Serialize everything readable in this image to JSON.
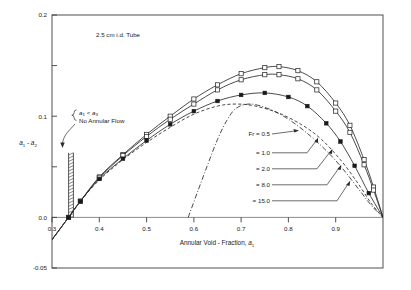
{
  "chart_data": {
    "type": "line",
    "title": "2.5 cm i.d. Tube",
    "xlabel": "Annular Void - Fraction, a1",
    "ylabel": "a1 - a2",
    "xlim": [
      0.3,
      1.0
    ],
    "ylim": [
      -0.05,
      0.2
    ],
    "grid": false,
    "legend_position": "inside-right",
    "xticks": [
      "0.3",
      "0.4",
      "0.5",
      "0.6",
      "0.7",
      "0.8",
      "0.9"
    ],
    "xtick_values": [
      0.3,
      0.4,
      0.5,
      0.6,
      0.7,
      0.8,
      0.9
    ],
    "yticks": [
      "0.2",
      "0.1",
      "0.0",
      "-0.05"
    ],
    "ytick_values": [
      0.2,
      0.1,
      0.0,
      -0.05
    ],
    "yminor_values": [
      0.15,
      0.05
    ],
    "annotations": [
      {
        "id": "tube-note",
        "text": "2.5 cm i.d. Tube",
        "x": 0.42,
        "y": 0.178
      },
      {
        "id": "no-flow-line1",
        "text": "a1 < a3",
        "x": 0.355,
        "y": 0.123
      },
      {
        "id": "no-flow-line2",
        "text": "No Annular Flow",
        "x": 0.355,
        "y": 0.113
      }
    ],
    "series": [
      {
        "name": "Fr = 0.5",
        "legend_label": "Fr  =  0.5",
        "style": "solid",
        "marker": "open-square",
        "x": [
          0.3,
          0.335,
          0.36,
          0.4,
          0.45,
          0.5,
          0.55,
          0.6,
          0.65,
          0.7,
          0.75,
          0.78,
          0.82,
          0.86,
          0.9,
          0.93,
          0.96,
          0.98,
          1.0
        ],
        "values": [
          -0.022,
          0.0,
          0.016,
          0.04,
          0.062,
          0.082,
          0.1,
          0.117,
          0.131,
          0.142,
          0.148,
          0.149,
          0.145,
          0.134,
          0.113,
          0.091,
          0.057,
          0.03,
          0.0
        ]
      },
      {
        "name": "Fr = 1.0",
        "legend_label": "=  1.0",
        "style": "solid",
        "marker": "open-square",
        "x": [
          0.3,
          0.335,
          0.36,
          0.4,
          0.45,
          0.5,
          0.55,
          0.6,
          0.65,
          0.7,
          0.75,
          0.78,
          0.82,
          0.86,
          0.9,
          0.93,
          0.96,
          0.98,
          1.0
        ],
        "values": [
          -0.022,
          0.0,
          0.016,
          0.039,
          0.061,
          0.08,
          0.097,
          0.112,
          0.126,
          0.136,
          0.141,
          0.141,
          0.137,
          0.126,
          0.105,
          0.084,
          0.052,
          0.027,
          0.0
        ]
      },
      {
        "name": "Fr = 2.0",
        "legend_label": "=  2.0",
        "style": "solid",
        "marker": "filled-square",
        "x": [
          0.3,
          0.335,
          0.36,
          0.4,
          0.45,
          0.5,
          0.55,
          0.6,
          0.65,
          0.7,
          0.75,
          0.8,
          0.84,
          0.88,
          0.91,
          0.94,
          0.97,
          1.0
        ],
        "values": [
          -0.022,
          0.0,
          0.016,
          0.038,
          0.058,
          0.076,
          0.092,
          0.105,
          0.115,
          0.121,
          0.123,
          0.119,
          0.11,
          0.093,
          0.075,
          0.051,
          0.024,
          0.0
        ]
      },
      {
        "name": "Fr = 8.0",
        "legend_label": "=  8.0",
        "style": "dashed",
        "marker": "none",
        "x": [
          0.3,
          0.335,
          0.36,
          0.4,
          0.45,
          0.5,
          0.55,
          0.6,
          0.65,
          0.69,
          0.73,
          0.78,
          0.83,
          0.87,
          0.91,
          0.945,
          0.975,
          1.0
        ],
        "values": [
          -0.022,
          0.0,
          0.016,
          0.037,
          0.057,
          0.074,
          0.089,
          0.102,
          0.11,
          0.112,
          0.11,
          0.103,
          0.091,
          0.077,
          0.057,
          0.035,
          0.014,
          0.0
        ]
      },
      {
        "name": "Fr = 15.0",
        "legend_label": "=  15.0",
        "style": "dash-dot",
        "marker": "none",
        "x": [
          0.588,
          0.61,
          0.63,
          0.65,
          0.67,
          0.69,
          0.72,
          0.76,
          0.8,
          0.84,
          0.88,
          0.915,
          0.95,
          0.975,
          1.0
        ],
        "values": [
          0.0,
          0.028,
          0.053,
          0.077,
          0.096,
          0.108,
          0.112,
          0.107,
          0.097,
          0.083,
          0.066,
          0.048,
          0.027,
          0.012,
          0.0
        ]
      }
    ],
    "regions": [
      {
        "id": "no-annular-flow-hatch",
        "label": "No Annular Flow boundary",
        "x": 0.335,
        "y_bottom": 0.0,
        "y_top": 0.052
      }
    ]
  },
  "legend": {
    "entries": [
      {
        "label": "Fr  =  0.5"
      },
      {
        "label": "=  1.0"
      },
      {
        "label": "=  2.0"
      },
      {
        "label": "=  8.0"
      },
      {
        "label": "=  15.0"
      }
    ]
  },
  "labels": {
    "ylabel_main": "a",
    "ylabel_sub1": "1",
    "ylabel_dash": " - ",
    "ylabel_main2": "a",
    "ylabel_sub2": "2",
    "xlabel_main": "Annular Void - Fraction, ",
    "xlabel_var": "a",
    "xlabel_sub": "1",
    "note_a1": "a",
    "note_sub1": "1",
    "note_lt": " < ",
    "note_a3": "a",
    "note_sub3": "3",
    "note_flow": "No Annular Flow",
    "tube_note": "2.5 cm i.d. Tube"
  },
  "ticks": {
    "x": [
      "0.3",
      "0.4",
      "0.5",
      "0.6",
      "0.7",
      "0.8",
      "0.9"
    ],
    "y": [
      "0.2",
      "0.1",
      "0.0",
      "-0.05"
    ]
  }
}
